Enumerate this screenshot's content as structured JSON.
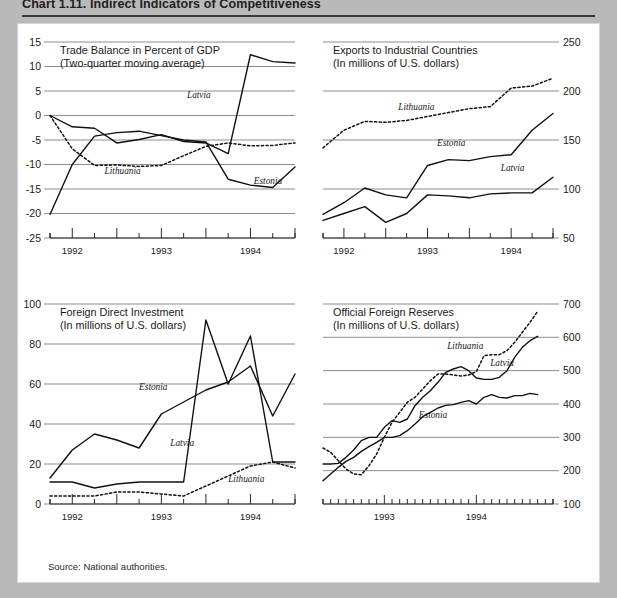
{
  "figure": {
    "title": "Chart 1.11.  Indirect Indicators of Competitiveness",
    "source": "Source:  National authorities."
  },
  "chart_data": [
    {
      "id": "trade-balance",
      "type": "line",
      "position": "top-left",
      "title": "Trade Balance in Percent of GDP",
      "subtitle": "(Two-quarter moving average)",
      "xlabel": "",
      "ylabel": "",
      "ylim": [
        -25,
        15
      ],
      "yticks": [
        15,
        10,
        5,
        0,
        -5,
        -10,
        -15,
        -20,
        -25
      ],
      "ytick_side": "left",
      "grid": true,
      "xlim": [
        0,
        11
      ],
      "xticklabels": [
        "1992",
        "1993",
        "1994"
      ],
      "xtick_positions": [
        1,
        5,
        9
      ],
      "x": [
        0,
        1,
        2,
        3,
        4,
        5,
        6,
        7,
        8,
        9,
        10,
        11
      ],
      "series": [
        {
          "name": "Latvia",
          "style": "solid",
          "label_x": 6.15,
          "label_y": 3.6,
          "values": [
            0.0,
            -2.3,
            -2.6,
            -5.6,
            -4.9,
            -3.9,
            -5.3,
            -5.6,
            -7.8,
            12.4,
            11.0,
            10.7
          ]
        },
        {
          "name": "Estonia",
          "style": "solid",
          "label_x": 9.15,
          "label_y": -14.0,
          "values": [
            -20.2,
            -10.0,
            -4.2,
            -3.5,
            -3.2,
            -4.1,
            -5.0,
            -5.4,
            -13.0,
            -14.2,
            -14.7,
            -10.5
          ]
        },
        {
          "name": "Lithuania",
          "style": "dotted",
          "label_x": 2.45,
          "label_y": -12.0,
          "values": [
            0.0,
            -6.8,
            -10.2,
            -10.1,
            -10.4,
            -10.2,
            -8.2,
            -6.3,
            -5.6,
            -6.2,
            -6.1,
            -5.6
          ]
        }
      ],
      "series_endpoints_note": "Estonia rises to -10.5 then -9.3 at final point; Lithuania ends near -5.2"
    },
    {
      "id": "exports-industrial-countries",
      "type": "line",
      "position": "top-right",
      "title": "Exports to Industrial Countries",
      "subtitle": "(In millions of U.S. dollars)",
      "xlabel": "",
      "ylabel": "",
      "ylim": [
        50,
        250
      ],
      "yticks": [
        250,
        200,
        150,
        100,
        50
      ],
      "ytick_side": "right",
      "grid": true,
      "xlim": [
        0,
        11
      ],
      "xticklabels": [
        "1992",
        "1993",
        "1994"
      ],
      "xtick_positions": [
        1,
        5,
        9
      ],
      "x": [
        0,
        1,
        2,
        3,
        4,
        5,
        6,
        7,
        8,
        9,
        10,
        11
      ],
      "series": [
        {
          "name": "Lithuania",
          "style": "dotted",
          "label_x": 3.6,
          "label_y": 181,
          "values": [
            142,
            160,
            169,
            168,
            170,
            174,
            178,
            182,
            184,
            203,
            205,
            213
          ]
        },
        {
          "name": "Estonia",
          "style": "solid",
          "label_x": 5.45,
          "label_y": 144,
          "values": [
            74,
            86,
            101,
            94,
            91,
            124,
            130,
            129,
            133,
            135,
            160,
            177
          ]
        },
        {
          "name": "Latvia",
          "style": "solid",
          "label_x": 8.5,
          "label_y": 118,
          "values": [
            68,
            75,
            82,
            66,
            75,
            94,
            93,
            91,
            95,
            96,
            96,
            112
          ]
        }
      ],
      "series_endpoints_note": "Lithuania ends at 238, Estonia ends at 230, Latvia ends at 133"
    },
    {
      "id": "foreign-direct-investment",
      "type": "line",
      "position": "bottom-left",
      "title": "Foreign Direct Investment",
      "subtitle": "(In millions of U.S. dollars)",
      "xlabel": "",
      "ylabel": "",
      "ylim": [
        0,
        100
      ],
      "yticks": [
        100,
        80,
        60,
        40,
        20,
        0
      ],
      "ytick_side": "left",
      "grid": true,
      "xlim": [
        0,
        11
      ],
      "xticklabels": [
        "1992",
        "1993",
        "1994"
      ],
      "xtick_positions": [
        1,
        5,
        9
      ],
      "x": [
        0,
        1,
        2,
        3,
        4,
        5,
        6,
        7,
        8,
        9,
        10,
        11
      ],
      "series": [
        {
          "name": "Estonia",
          "style": "solid",
          "label_x": 4.0,
          "label_y": 57,
          "values": [
            13,
            27,
            35,
            32,
            28,
            45,
            51,
            57,
            61,
            69,
            44,
            65
          ]
        },
        {
          "name": "Latvia",
          "style": "solid",
          "label_x": 5.4,
          "label_y": 29,
          "values": [
            11,
            11,
            8,
            10,
            11,
            11,
            11,
            92,
            60,
            84,
            21,
            21
          ]
        },
        {
          "name": "Lithuania",
          "style": "dotted",
          "label_x": 8.0,
          "label_y": 11,
          "values": [
            4,
            4,
            4,
            6,
            6,
            5,
            4,
            9,
            14,
            19,
            21,
            18
          ]
        }
      ],
      "series_endpoints_note": "Latvia spikes to 92 then drops to 21 flat; Lithuania ends near 15"
    },
    {
      "id": "official-foreign-reserves",
      "type": "line",
      "position": "bottom-right",
      "title": "Official Foreign Reserves",
      "subtitle": "(In millions of U.S. dollars)",
      "xlabel": "",
      "ylabel": "",
      "ylim": [
        100,
        700
      ],
      "yticks": [
        700,
        600,
        500,
        400,
        300,
        200,
        100
      ],
      "ytick_side": "right",
      "grid": true,
      "xlim": [
        0,
        30
      ],
      "xtick_interval": "monthly",
      "xticklabels": [
        "1993",
        "1994"
      ],
      "xtick_positions": [
        8,
        20
      ],
      "x": [
        0,
        1,
        2,
        3,
        4,
        5,
        6,
        7,
        8,
        9,
        10,
        11,
        12,
        13,
        14,
        15,
        16,
        17,
        18,
        19,
        20,
        21,
        22,
        23,
        24,
        25,
        26,
        27,
        28
      ],
      "series": [
        {
          "name": "Lithuania",
          "style": "dotted",
          "label_x": 16.2,
          "label_y": 566,
          "values": [
            268,
            255,
            230,
            205,
            190,
            188,
            215,
            250,
            300,
            345,
            375,
            405,
            420,
            445,
            470,
            490,
            490,
            487,
            484,
            487,
            497,
            545,
            548,
            548,
            560,
            585,
            615,
            645,
            678
          ]
        },
        {
          "name": "Latvia",
          "style": "solid",
          "label_x": 21.8,
          "label_y": 515,
          "values": [
            220,
            220,
            222,
            240,
            262,
            290,
            300,
            300,
            330,
            350,
            345,
            355,
            395,
            420,
            440,
            465,
            495,
            505,
            512,
            500,
            478,
            474,
            474,
            480,
            500,
            540,
            570,
            590,
            603
          ]
        },
        {
          "name": "Estonia",
          "style": "solid",
          "label_x": 12.5,
          "label_y": 358,
          "values": [
            170,
            190,
            210,
            228,
            240,
            258,
            272,
            285,
            300,
            300,
            305,
            320,
            340,
            362,
            375,
            388,
            396,
            398,
            405,
            410,
            400,
            420,
            428,
            420,
            418,
            425,
            425,
            432,
            428
          ]
        }
      ],
      "series_endpoints_note": "Lithuania dotted rises to 678; Latvia solid ends at 603; Estonia ends near 428"
    }
  ]
}
